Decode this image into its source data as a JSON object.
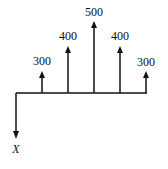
{
  "diagram": {
    "type": "cash-flow",
    "axis": {
      "y": 93,
      "x_start": 16,
      "x_end": 147
    },
    "outflow": {
      "x": 16,
      "y_end": 139,
      "label": "X"
    },
    "inflows": [
      {
        "x": 42,
        "top": 71,
        "label": "300"
      },
      {
        "x": 68,
        "top": 46,
        "label": "400"
      },
      {
        "x": 94,
        "top": 21,
        "label": "500"
      },
      {
        "x": 120,
        "top": 46,
        "label": "400"
      },
      {
        "x": 146,
        "top": 71,
        "label": "300"
      }
    ],
    "stroke_color": "#111111"
  }
}
